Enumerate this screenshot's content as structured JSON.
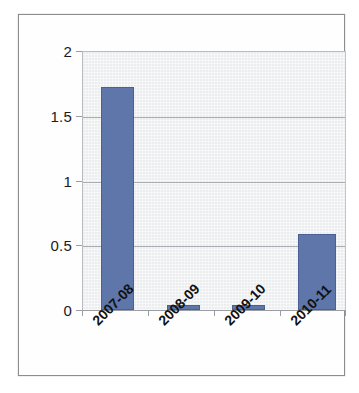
{
  "chart_data": {
    "type": "bar",
    "title": "",
    "subtitle": "",
    "xlabel": "",
    "ylabel": "",
    "categories": [
      "2007-08",
      "2008-09",
      "2009-10",
      "2010-11"
    ],
    "values": [
      1.73,
      0.04,
      0.04,
      0.59
    ],
    "series": [
      {
        "name": "Series 1",
        "values": [
          1.73,
          0.04,
          0.04,
          0.59
        ]
      }
    ],
    "ylim": [
      0,
      2
    ],
    "yticks": [
      "0",
      "0.5",
      "1",
      "1.5",
      "2"
    ],
    "ytick_values": [
      0,
      0.5,
      1,
      1.5,
      2
    ],
    "grid": "horizontal",
    "legend": "none",
    "bar_color": "#5f76ab",
    "plot_background": "#ecedef",
    "gridline_color": "#a9acb1",
    "axis_color": "#9a9da2",
    "frame_color": "#8d8d8d",
    "xtick_rotation": -45,
    "annotations": []
  }
}
